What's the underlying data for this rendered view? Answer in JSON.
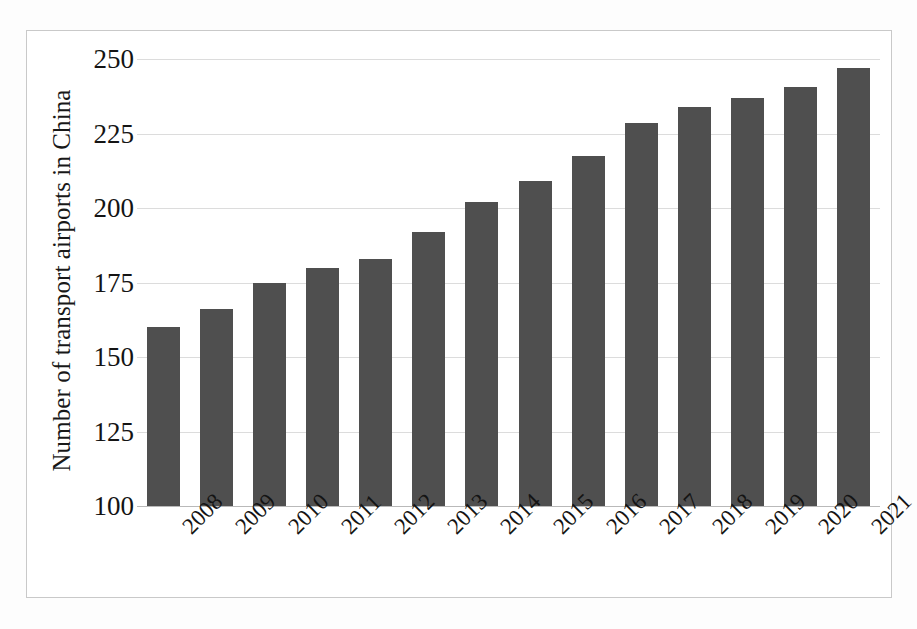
{
  "chart_data": {
    "type": "bar",
    "title": "",
    "subtitle": "",
    "xlabel": "",
    "ylabel": "Number of transport airports in China",
    "categories": [
      "2008",
      "2009",
      "2010",
      "2011",
      "2012",
      "2013",
      "2014",
      "2015",
      "2016",
      "2017",
      "2018",
      "2019",
      "2020",
      "2021"
    ],
    "values": [
      160,
      166,
      175,
      180,
      183,
      192,
      202,
      209,
      217.5,
      228.5,
      234,
      237,
      240.5,
      247
    ],
    "series": [
      {
        "name": "Number of transport airports in China",
        "values": [
          160,
          166,
          175,
          180,
          183,
          192,
          202,
          209,
          217.5,
          228.5,
          234,
          237,
          240.5,
          247
        ]
      }
    ],
    "ylim": [
      100,
      250
    ],
    "ytick_labels": [
      "250",
      "225",
      "200",
      "175",
      "150",
      "125",
      "100"
    ],
    "ytick_values": [
      250,
      225,
      200,
      175,
      150,
      125,
      100
    ],
    "grid": "horizontal",
    "legend": "none",
    "bar_color": "#4f4f4f",
    "gridline_color": "#dcdcdc",
    "frame_color": "#c9c9c9",
    "background_color": "#ffffff",
    "xtick_rotation": -45
  }
}
